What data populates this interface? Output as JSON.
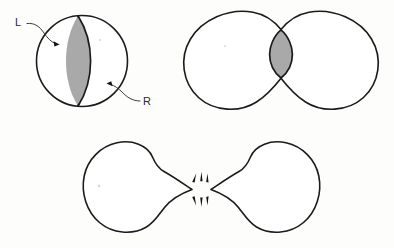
{
  "figure": {
    "background_color": "#fdfdfc",
    "outline_color": "#1b1b1b",
    "shaded_color": "#a9a9a9",
    "label_color": "#2a2a2a"
  },
  "panels": [
    {
      "id": "panel-sphere",
      "name": "undivided-sphere",
      "description": "Single circle with shaded lens-shaped septum and curved dividing line",
      "center": [
        82,
        61
      ],
      "radius": 45,
      "shaded_region": "lens",
      "labels": [
        {
          "id": "label-left",
          "name": "label-l",
          "text": "L",
          "x": 17,
          "y": 26,
          "arrow_tip": [
            58,
            44
          ]
        },
        {
          "id": "label-right",
          "name": "label-r",
          "text": "R",
          "x": 143,
          "y": 104,
          "arrow_tip": [
            108,
            84
          ]
        }
      ]
    },
    {
      "id": "panel-dumbbell",
      "name": "constricted-dumbbell",
      "description": "Two lobes joined at a narrow neck containing a shaded ellipse",
      "left_lobe_center": [
        229,
        60
      ],
      "right_lobe_center": [
        333,
        60
      ],
      "lobe_radius": 46,
      "neck_center": [
        281,
        61
      ],
      "shaded_region": "neck-ellipse"
    },
    {
      "id": "panel-separated",
      "name": "separated-teardrops",
      "description": "Two pointed teardrop shapes pulled apart with radiating burst marks at the separation point",
      "left_tip": [
        192,
        189
      ],
      "right_tip": [
        211,
        189
      ],
      "burst_center": [
        201,
        189
      ],
      "burst_ray_count_upper": 3,
      "burst_ray_count_lower": 3
    }
  ],
  "legend": {
    "l_meaning": "L",
    "r_meaning": "R"
  }
}
